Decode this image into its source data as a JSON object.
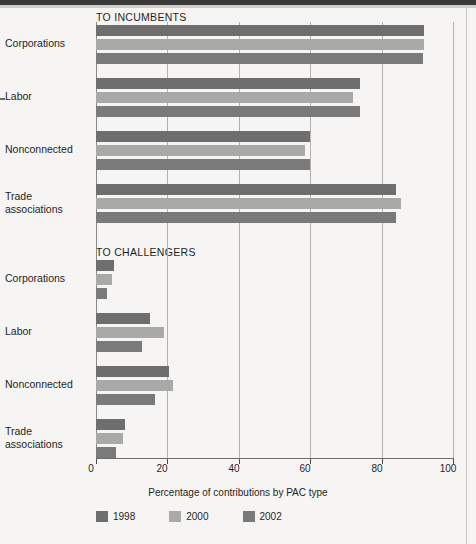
{
  "figure": {
    "axis_title": "Percentage of contributions by PAC type",
    "sections": [
      {
        "id": "incumbents",
        "title": "TO INCUMBENTS"
      },
      {
        "id": "challengers",
        "title": "TO CHALLENGERS"
      }
    ],
    "categories": [
      "Corporations",
      "Labor",
      "Nonconnected",
      "Trade associations"
    ],
    "category_lines": [
      [
        "Corporations"
      ],
      [
        "Labor"
      ],
      [
        "Nonconnected"
      ],
      [
        "Trade",
        "associations"
      ]
    ],
    "tick_labels": [
      "0",
      "20",
      "40",
      "60",
      "80",
      "100"
    ],
    "legend": [
      {
        "label": "1998",
        "color": "#6e6e6e"
      },
      {
        "label": "2000",
        "color": "#a9a9a7"
      },
      {
        "label": "2002",
        "color": "#7a7a7a"
      }
    ]
  },
  "chart_data": {
    "type": "bar",
    "orientation": "horizontal",
    "title": "",
    "xlabel": "Percentage of contributions by PAC type",
    "ylabel": "",
    "xlim": [
      0,
      100
    ],
    "xticks": [
      0,
      20,
      40,
      60,
      80,
      100
    ],
    "grid": true,
    "legend_position": "bottom",
    "panels": [
      {
        "name": "TO INCUMBENTS",
        "categories": [
          "Corporations",
          "Labor",
          "Nonconnected",
          "Trade associations"
        ],
        "series": [
          {
            "name": "1998",
            "color": "#6e6e6e",
            "values": [
              92,
              74,
              60,
              84
            ]
          },
          {
            "name": "2000",
            "color": "#a9a9a7",
            "values": [
              92,
              72,
              58.5,
              85.5
            ]
          },
          {
            "name": "2002",
            "color": "#7a7a7a",
            "values": [
              91.5,
              74,
              60,
              84
            ]
          }
        ]
      },
      {
        "name": "TO CHALLENGERS",
        "categories": [
          "Corporations",
          "Labor",
          "Nonconnected",
          "Trade associations"
        ],
        "series": [
          {
            "name": "1998",
            "color": "#6e6e6e",
            "values": [
              5,
              15,
              20.5,
              8
            ]
          },
          {
            "name": "2000",
            "color": "#a9a9a7",
            "values": [
              4.5,
              19,
              21.5,
              7.5
            ]
          },
          {
            "name": "2002",
            "color": "#7a7a7a",
            "values": [
              3,
              13,
              16.5,
              5.5
            ]
          }
        ]
      }
    ]
  }
}
